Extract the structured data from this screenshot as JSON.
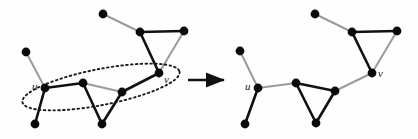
{
  "figure": {
    "background": "#fefefe",
    "edge_black": "#111111",
    "edge_gray": "#9a9a9a",
    "node_color": "#0a0a0a",
    "node_radius": 4.4,
    "ellipse_color": "#1a1a1a",
    "arrow_color": "#111111"
  },
  "labels": {
    "u_left": "u",
    "v_left": "v",
    "u_right": "u",
    "v_right": "v"
  },
  "arrow": {
    "name": "transformation-arrow",
    "x1": 188,
    "y1": 80,
    "x2": 224,
    "y2": 80
  },
  "left_graph": {
    "name": "graph-before",
    "nodes": [
      {
        "id": "t0",
        "x": 103,
        "y": 14
      },
      {
        "id": "t1",
        "x": 140,
        "y": 32
      },
      {
        "id": "t2",
        "x": 184,
        "y": 31
      },
      {
        "id": "a0",
        "x": 26,
        "y": 52
      },
      {
        "id": "u",
        "x": 45,
        "y": 88
      },
      {
        "id": "b0",
        "x": 35,
        "y": 124
      },
      {
        "id": "c1",
        "x": 83,
        "y": 83
      },
      {
        "id": "c2",
        "x": 102,
        "y": 124
      },
      {
        "id": "c3",
        "x": 122,
        "y": 92
      },
      {
        "id": "v",
        "x": 159,
        "y": 73
      }
    ],
    "edges": [
      {
        "from": "t0",
        "to": "t1",
        "color": "gray"
      },
      {
        "from": "t1",
        "to": "t2",
        "color": "black"
      },
      {
        "from": "t1",
        "to": "v",
        "color": "black"
      },
      {
        "from": "t2",
        "to": "v",
        "color": "gray"
      },
      {
        "from": "a0",
        "to": "u",
        "color": "gray"
      },
      {
        "from": "u",
        "to": "b0",
        "color": "black"
      },
      {
        "from": "u",
        "to": "c1",
        "color": "black"
      },
      {
        "from": "c1",
        "to": "c2",
        "color": "black"
      },
      {
        "from": "c2",
        "to": "c3",
        "color": "black"
      },
      {
        "from": "c1",
        "to": "c3",
        "color": "gray"
      },
      {
        "from": "c3",
        "to": "v",
        "color": "black"
      }
    ],
    "ellipse": {
      "cx": 101,
      "cy": 87,
      "rx": 80,
      "ry": 18,
      "rotate": -11
    }
  },
  "right_graph": {
    "name": "graph-after",
    "nodes": [
      {
        "id": "t0",
        "x": 315,
        "y": 14
      },
      {
        "id": "t1",
        "x": 352,
        "y": 32
      },
      {
        "id": "t2",
        "x": 397,
        "y": 31
      },
      {
        "id": "a0",
        "x": 240,
        "y": 51
      },
      {
        "id": "u",
        "x": 258,
        "y": 88
      },
      {
        "id": "b0",
        "x": 245,
        "y": 124
      },
      {
        "id": "c1",
        "x": 296,
        "y": 83
      },
      {
        "id": "c2",
        "x": 316,
        "y": 123
      },
      {
        "id": "c3",
        "x": 335,
        "y": 91
      },
      {
        "id": "v",
        "x": 372,
        "y": 73
      }
    ],
    "edges": [
      {
        "from": "t0",
        "to": "t1",
        "color": "gray"
      },
      {
        "from": "t1",
        "to": "t2",
        "color": "black"
      },
      {
        "from": "t1",
        "to": "v",
        "color": "black"
      },
      {
        "from": "t2",
        "to": "v",
        "color": "gray"
      },
      {
        "from": "a0",
        "to": "u",
        "color": "gray"
      },
      {
        "from": "u",
        "to": "b0",
        "color": "black"
      },
      {
        "from": "u",
        "to": "c1",
        "color": "gray"
      },
      {
        "from": "c1",
        "to": "c2",
        "color": "black"
      },
      {
        "from": "c2",
        "to": "c3",
        "color": "black"
      },
      {
        "from": "c1",
        "to": "c3",
        "color": "black"
      },
      {
        "from": "c3",
        "to": "v",
        "color": "gray"
      }
    ]
  }
}
